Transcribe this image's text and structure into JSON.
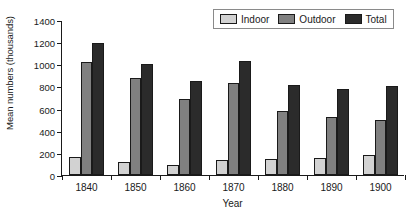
{
  "chart_data": {
    "type": "bar",
    "title": "",
    "xlabel": "Year",
    "ylabel": "Mean numbers (thousands)",
    "categories": [
      "1840",
      "1850",
      "1860",
      "1870",
      "1880",
      "1890",
      "1900"
    ],
    "series": [
      {
        "name": "Indoor",
        "color": "#d2d2d2",
        "values": [
          160,
          115,
          90,
          135,
          145,
          155,
          185
        ]
      },
      {
        "name": "Outdoor",
        "color": "#808080",
        "values": [
          1020,
          880,
          685,
          830,
          575,
          525,
          495
        ]
      },
      {
        "name": "Total",
        "color": "#2b2b2b",
        "values": [
          1195,
          1005,
          845,
          1030,
          810,
          780,
          800
        ]
      }
    ],
    "ylim": [
      0,
      1400
    ],
    "yticks": [
      0,
      200,
      400,
      600,
      800,
      1000,
      1200,
      1400
    ],
    "ytick_labels": [
      "0",
      "200",
      "400",
      "600",
      "800",
      "1000",
      "1200",
      "1400"
    ],
    "grid": false,
    "legend": {
      "position": "top-right",
      "orientation": "horizontal",
      "entries": [
        "Indoor",
        "Outdoor",
        "Total"
      ]
    }
  }
}
